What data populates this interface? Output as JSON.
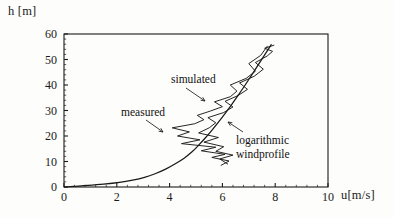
{
  "figure": {
    "y_axis_title": "h  [m]",
    "x_axis_title": "u[m/s]"
  },
  "annotations": {
    "simulated": "simulated",
    "measured": "measured",
    "logprofile_line1": "logarithmic",
    "logprofile_line2": "windprofile"
  },
  "chart_data": {
    "type": "line",
    "title": "",
    "xlabel": "u[m/s]",
    "ylabel": "h  [m]",
    "xlim": [
      0,
      10
    ],
    "ylim": [
      0,
      60
    ],
    "xticks": [
      0,
      2,
      4,
      6,
      8,
      10
    ],
    "yticks": [
      0,
      10,
      20,
      30,
      40,
      50,
      60
    ],
    "xtick_labels": [
      "0",
      "2",
      "4",
      "6",
      "8",
      "10"
    ],
    "ytick_labels": [
      "0",
      "10",
      "20",
      "30",
      "40",
      "50",
      "60"
    ],
    "minor_tick_interval_x": 0.4,
    "minor_tick_interval_y": 2,
    "grid": false,
    "legend": "none",
    "frame": "box",
    "orientation": "height-on-y",
    "line_color": "#1a1a1a",
    "series": [
      {
        "name": "logarithmic windprofile",
        "style": "smooth",
        "u": [
          0.02,
          0.35,
          0.9,
          1.5,
          2.1,
          2.6,
          3.05,
          3.45,
          3.85,
          4.2,
          4.55,
          4.85,
          5.1,
          5.35,
          5.6,
          5.85,
          6.1,
          6.35,
          6.6,
          6.85,
          7.1,
          7.35,
          7.6,
          7.85
        ],
        "h": [
          0.0,
          0.25,
          0.6,
          1.1,
          1.8,
          2.7,
          3.8,
          5.2,
          7.0,
          9.0,
          11.3,
          13.8,
          16.4,
          19.2,
          22.2,
          25.4,
          28.8,
          32.3,
          36.0,
          39.8,
          43.8,
          47.8,
          51.8,
          55.8
        ]
      },
      {
        "name": "measured",
        "style": "jagged",
        "u": [
          5.95,
          6.25,
          5.6,
          6.1,
          5.2,
          5.75,
          4.45,
          5.15,
          4.3,
          4.75,
          4.1,
          4.95,
          5.3,
          5.05,
          5.55,
          6.0,
          5.7,
          6.3,
          6.55,
          6.3,
          6.9,
          7.25,
          7.0,
          7.45,
          7.7
        ],
        "h": [
          8.5,
          10.2,
          11.6,
          12.8,
          14.2,
          15.6,
          17.0,
          18.5,
          20.0,
          21.6,
          23.2,
          24.8,
          26.4,
          28.1,
          29.8,
          31.5,
          33.4,
          35.4,
          37.6,
          40.0,
          42.6,
          45.4,
          48.4,
          51.6,
          55.2
        ]
      },
      {
        "name": "simulated",
        "style": "jagged",
        "u": [
          6.2,
          5.9,
          6.4,
          5.75,
          6.05,
          5.3,
          5.85,
          5.1,
          5.5,
          5.75,
          5.45,
          6.05,
          6.4,
          6.1,
          6.6,
          6.95,
          6.65,
          7.2,
          7.55,
          7.25,
          7.7,
          7.9,
          7.6,
          7.95
        ],
        "h": [
          9.0,
          11.0,
          12.5,
          14.0,
          15.8,
          17.6,
          19.4,
          21.2,
          23.2,
          25.2,
          27.2,
          29.2,
          31.4,
          33.6,
          35.9,
          38.3,
          40.8,
          43.4,
          46.2,
          48.8,
          51.4,
          53.2,
          54.4,
          55.6
        ]
      }
    ]
  }
}
